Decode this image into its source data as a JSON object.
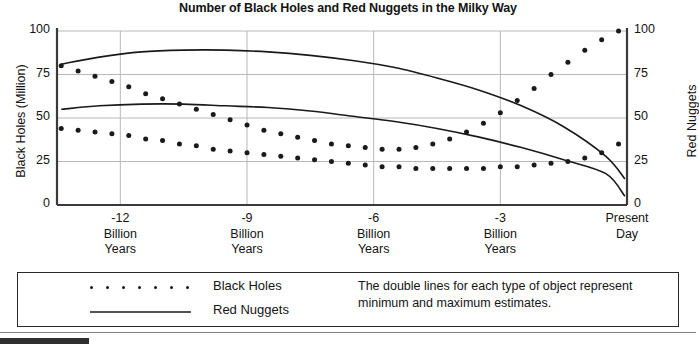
{
  "chart_title": "Number of Black Holes and Red Nuggets in the Milky Way",
  "axes": {
    "y_left_title": "Black Holes (Million)",
    "y_right_title": "Red Nuggets",
    "y_ticks": [
      "0",
      "25",
      "50",
      "75",
      "100"
    ],
    "x_ticks": [
      "-12\nBillion\nYears",
      "-9\nBillion\nYears",
      "-6\nBillion\nYears",
      "-3\nBillion\nYears",
      "Present\nDay"
    ]
  },
  "legend": {
    "black_holes_label": "Black Holes",
    "red_nuggets_label": "Red Nuggets",
    "note": "The double lines for each type of object represent minimum and maximum estimates."
  },
  "chart_data": {
    "type": "line",
    "title": "Number of Black Holes and Red Nuggets in the Milky Way",
    "xlabel": "Billion Years",
    "ylabel": "Black Holes (Million)",
    "ylabel_right": "Red Nuggets",
    "xlim": [
      -13.5,
      0
    ],
    "ylim": [
      0,
      100
    ],
    "y_ticks": [
      0,
      25,
      50,
      75,
      100
    ],
    "y_ticks_right": [
      0,
      25,
      50,
      75,
      100
    ],
    "x_tick_values": [
      -12,
      -9,
      -6,
      -3,
      0
    ],
    "x_tick_labels": [
      "-12 Billion Years",
      "-9 Billion Years",
      "-6 Billion Years",
      "-3 Billion Years",
      "Present Day"
    ],
    "grid": true,
    "legend_position": "below-plot",
    "series": [
      {
        "name": "Black Holes (maximum estimate)",
        "style": "dotted",
        "axis": "left",
        "x": [
          -13.4,
          -13.0,
          -12.6,
          -12.2,
          -11.8,
          -11.4,
          -11.0,
          -10.6,
          -10.2,
          -9.8,
          -9.4,
          -9.0,
          -8.6,
          -8.2,
          -7.8,
          -7.4,
          -7.0,
          -6.6,
          -6.2,
          -5.8,
          -5.4,
          -5.0,
          -4.6,
          -4.2,
          -3.8,
          -3.4,
          -3.0,
          -2.6,
          -2.2,
          -1.8,
          -1.4,
          -1.0,
          -0.6,
          -0.2
        ],
        "values": [
          80,
          77,
          74,
          71,
          68,
          64,
          61,
          58,
          55,
          52,
          49,
          46,
          43,
          41,
          39,
          37,
          35,
          34,
          33,
          32,
          32,
          33,
          35,
          38,
          42,
          47,
          53,
          60,
          67,
          75,
          82,
          89,
          95,
          100
        ]
      },
      {
        "name": "Black Holes (minimum estimate)",
        "style": "dotted",
        "axis": "left",
        "x": [
          -13.4,
          -13.0,
          -12.6,
          -12.2,
          -11.8,
          -11.4,
          -11.0,
          -10.6,
          -10.2,
          -9.8,
          -9.4,
          -9.0,
          -8.6,
          -8.2,
          -7.8,
          -7.4,
          -7.0,
          -6.6,
          -6.2,
          -5.8,
          -5.4,
          -5.0,
          -4.6,
          -4.2,
          -3.8,
          -3.4,
          -3.0,
          -2.6,
          -2.2,
          -1.8,
          -1.4,
          -1.0,
          -0.6,
          -0.2
        ],
        "values": [
          44,
          43,
          42,
          41,
          40,
          38,
          37,
          35,
          34,
          32,
          31,
          30,
          29,
          28,
          27,
          26,
          25,
          24,
          23,
          22,
          22,
          21,
          21,
          21,
          21,
          21,
          22,
          22,
          23,
          24,
          25,
          27,
          30,
          35
        ]
      },
      {
        "name": "Red Nuggets (maximum estimate)",
        "style": "solid",
        "axis": "right",
        "x": [
          -13.4,
          -12.5,
          -11.5,
          -10.5,
          -9.5,
          -8.5,
          -7.5,
          -6.5,
          -5.5,
          -4.5,
          -3.5,
          -2.5,
          -1.5,
          -0.5,
          -0.05
        ],
        "values": [
          81,
          85,
          88,
          89,
          89,
          88,
          86,
          83,
          79,
          73,
          66,
          57,
          45,
          28,
          15
        ]
      },
      {
        "name": "Red Nuggets (minimum estimate)",
        "style": "solid",
        "axis": "right",
        "x": [
          -13.4,
          -12.5,
          -11.5,
          -10.5,
          -9.5,
          -8.5,
          -7.5,
          -6.5,
          -5.5,
          -4.5,
          -3.5,
          -2.5,
          -1.5,
          -0.5,
          -0.05
        ],
        "values": [
          55,
          57,
          58,
          58,
          57,
          56,
          54,
          51,
          48,
          44,
          39,
          33,
          26,
          18,
          5
        ]
      }
    ],
    "annotations": [
      "The double lines for each type of object represent minimum and maximum estimates."
    ]
  },
  "colors": {
    "ink": "#1a1a1a",
    "grid": "#b8b8b8",
    "axis": "#3a3a3a"
  }
}
